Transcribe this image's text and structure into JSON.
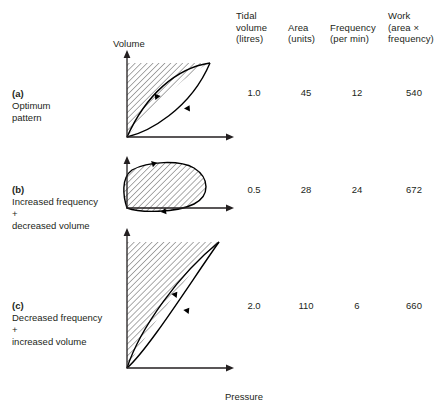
{
  "figure": {
    "axis_labels": {
      "y": "Volume",
      "x": "Pressure"
    },
    "columns": [
      {
        "key": "tidal_volume",
        "header": "Tidal\nvolume\n(litres)"
      },
      {
        "key": "area",
        "header": "Area\n(units)"
      },
      {
        "key": "frequency",
        "header": "Frequency\n(per min)"
      },
      {
        "key": "work",
        "header": "Work\n(area ×\nfrequency)"
      }
    ],
    "rows": [
      {
        "marker": "(a)",
        "label": "Optimum\npattern",
        "tidal_volume": "1.0",
        "area": "45",
        "frequency": "12",
        "work": "540"
      },
      {
        "marker": "(b)",
        "label": "Increased frequency\n+\ndecreased volume",
        "tidal_volume": "0.5",
        "area": "28",
        "frequency": "24",
        "work": "672"
      },
      {
        "marker": "(c)",
        "label": "Decreased frequency\n+\nincreased volume",
        "tidal_volume": "2.0",
        "area": "110",
        "frequency": "6",
        "work": "660"
      }
    ],
    "colors": {
      "ink": "#231f20",
      "hatch": "#555555",
      "background": "#ffffff"
    }
  }
}
